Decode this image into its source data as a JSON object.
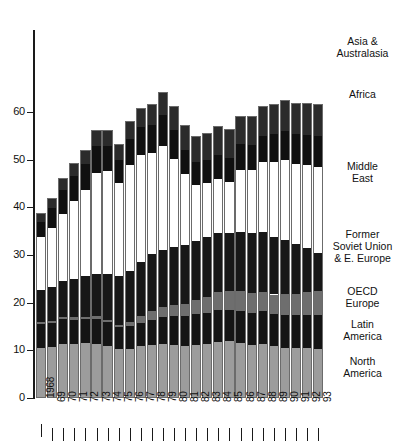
{
  "chart_data": {
    "type": "bar",
    "stacked": true,
    "title": "",
    "subtitle": "",
    "xlabel": "",
    "ylabel": "",
    "grid": false,
    "legend_position": "right",
    "categories": [
      "1968",
      "69",
      "70",
      "71",
      "72",
      "73",
      "74",
      "75",
      "76",
      "77",
      "78",
      "79",
      "80",
      "81",
      "82",
      "83",
      "84",
      "85",
      "86",
      "87",
      "88",
      "89",
      "90",
      "91",
      "92",
      "93"
    ],
    "ylim": [
      0,
      68
    ],
    "yticks": [
      0,
      10,
      20,
      30,
      40,
      50,
      60
    ],
    "ytick_labels": [
      "0",
      "10",
      "20",
      "30",
      "40",
      "50",
      "60"
    ],
    "series": [
      {
        "name": "North America",
        "color": "#9c9c9c",
        "values": [
          10.5,
          10.6,
          11.3,
          11.3,
          11.5,
          11.4,
          11.0,
          10.2,
          10.2,
          10.8,
          11.2,
          11.4,
          11.2,
          11.0,
          11.1,
          11.3,
          11.7,
          11.9,
          11.5,
          11.2,
          11.3,
          10.8,
          10.5,
          10.4,
          10.4,
          10.3
        ],
        "legend_label": "North\nAmerica"
      },
      {
        "name": "Latin America",
        "color": "#141414",
        "values": [
          5.0,
          5.1,
          5.2,
          5.1,
          5.0,
          5.2,
          4.9,
          4.6,
          4.8,
          5.0,
          5.2,
          5.5,
          5.9,
          6.1,
          6.5,
          6.5,
          6.7,
          6.6,
          6.8,
          6.7,
          6.9,
          6.8,
          7.0,
          7.0,
          7.1,
          7.2
        ],
        "legend_label": "Latin\nAmerica"
      },
      {
        "name": "OECD Europe",
        "color": "#6e6e6e",
        "values": [
          0.4,
          0.4,
          0.4,
          0.5,
          0.5,
          0.5,
          0.5,
          0.6,
          0.9,
          1.4,
          1.8,
          2.1,
          2.4,
          2.6,
          3.0,
          3.4,
          3.9,
          4.0,
          4.1,
          4.1,
          4.0,
          4.1,
          4.3,
          4.5,
          4.8,
          4.9
        ],
        "legend_label": "OECD\nEurope"
      },
      {
        "name": "Former Soviet Union & E. Europe",
        "color": "#171717",
        "values": [
          6.7,
          7.1,
          7.6,
          8.1,
          8.5,
          9.0,
          9.6,
          10.2,
          10.8,
          11.4,
          11.9,
          12.1,
          12.2,
          12.3,
          12.4,
          12.5,
          12.3,
          12.1,
          12.5,
          12.6,
          12.6,
          12.1,
          11.4,
          10.4,
          9.1,
          8.1
        ],
        "legend_label": "Former\nSoviet Union\n& E. Europe"
      },
      {
        "name": "Middle East",
        "color": "#ffffff",
        "values": [
          11.2,
          12.4,
          14.0,
          16.3,
          18.1,
          21.1,
          21.5,
          19.4,
          22.1,
          22.4,
          21.2,
          21.8,
          18.4,
          15.0,
          11.7,
          11.3,
          11.4,
          10.6,
          13.0,
          13.2,
          14.6,
          15.6,
          16.6,
          16.8,
          17.4,
          18.0
        ],
        "legend_label": "Middle\nEast"
      },
      {
        "name": "Africa",
        "color": "#101010",
        "values": [
          3.0,
          4.2,
          5.2,
          5.3,
          5.5,
          5.7,
          5.3,
          4.9,
          5.5,
          5.8,
          5.9,
          6.4,
          6.1,
          5.0,
          4.8,
          4.8,
          5.0,
          5.2,
          5.3,
          5.3,
          5.6,
          5.9,
          6.1,
          6.2,
          6.4,
          6.4
        ],
        "legend_label": "Africa"
      },
      {
        "name": "Asia & Australasia",
        "color": "#2b2b2b",
        "values": [
          2.0,
          2.2,
          2.4,
          2.6,
          2.9,
          3.2,
          3.3,
          3.4,
          3.7,
          4.1,
          4.4,
          4.9,
          5.1,
          5.3,
          5.5,
          5.7,
          6.0,
          5.9,
          6.0,
          6.1,
          6.3,
          6.4,
          6.5,
          6.6,
          6.7,
          6.8
        ],
        "legend_label": "Asia &\nAustralasia"
      }
    ],
    "totals": [
      38.8,
      42.0,
      46.1,
      49.2,
      52.0,
      56.1,
      56.1,
      53.3,
      58.0,
      60.9,
      61.6,
      64.2,
      61.3,
      57.3,
      55.0,
      55.5,
      57.0,
      56.3,
      59.2,
      59.2,
      61.3,
      61.7,
      62.4,
      61.9,
      61.9,
      61.7
    ]
  },
  "axis": {
    "y_tick_labels": [
      "60",
      "50",
      "40",
      "30",
      "20",
      "10",
      "0"
    ],
    "x_tick_labels": [
      "1968",
      "69",
      "70",
      "71",
      "72",
      "73",
      "74",
      "75",
      "76",
      "77",
      "78",
      "79",
      "80",
      "81",
      "82",
      "83",
      "84",
      "85",
      "86",
      "87",
      "88",
      "89",
      "90",
      "91",
      "92",
      "93"
    ]
  },
  "legend": {
    "entries": [
      {
        "name": "asia-australasia",
        "line1": "Asia &",
        "line2": "Australasia"
      },
      {
        "name": "africa",
        "line1": "Africa",
        "line2": ""
      },
      {
        "name": "middle-east",
        "line1": "Middle",
        "line2": "East"
      },
      {
        "name": "former-soviet-union",
        "line1": "Former",
        "line2": "Soviet Union",
        "line3": "& E. Europe"
      },
      {
        "name": "oecd-europe",
        "line1": "OECD",
        "line2": "Europe"
      },
      {
        "name": "latin-america",
        "line1": "Latin",
        "line2": "America"
      },
      {
        "name": "north-america",
        "line1": "North",
        "line2": "America"
      }
    ]
  },
  "colors": {
    "north_america": "#9c9c9c",
    "latin_america": "#141414",
    "oecd_europe": "#6e6e6e",
    "former_soviet": "#171717",
    "middle_east": "#ffffff",
    "africa": "#101010",
    "asia": "#2b2b2b",
    "axis": "#1a1a1a"
  }
}
